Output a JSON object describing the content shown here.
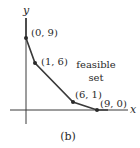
{
  "figure": {
    "caption": "(b)",
    "axes": {
      "x_label": "x",
      "y_label": "y"
    },
    "region_label": {
      "line1": "feasible",
      "line2": "set"
    },
    "points": [
      {
        "label": "(0, 9)",
        "x": 0,
        "y": 9
      },
      {
        "label": "(1, 6)",
        "x": 1,
        "y": 6
      },
      {
        "label": "(6, 1)",
        "x": 6,
        "y": 1
      },
      {
        "label": "(9, 0)",
        "x": 9,
        "y": 0
      }
    ],
    "colors": {
      "line": "#3a3a3a",
      "point": "#2a2a2a",
      "text": "#2a2a2a"
    }
  }
}
